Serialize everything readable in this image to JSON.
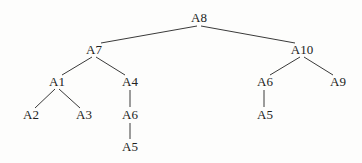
{
  "diagram": {
    "type": "tree",
    "nodes": [
      {
        "id": "n_A8",
        "label": "A8",
        "x": 199,
        "y": 18
      },
      {
        "id": "n_A7",
        "label": "A7",
        "x": 94,
        "y": 50
      },
      {
        "id": "n_A10",
        "label": "A10",
        "x": 302,
        "y": 50
      },
      {
        "id": "n_A1",
        "label": "A1",
        "x": 57,
        "y": 82
      },
      {
        "id": "n_A4",
        "label": "A4",
        "x": 130,
        "y": 82
      },
      {
        "id": "n_A2",
        "label": "A2",
        "x": 31,
        "y": 115
      },
      {
        "id": "n_A3",
        "label": "A3",
        "x": 84,
        "y": 115
      },
      {
        "id": "n_A6a",
        "label": "A6",
        "x": 130,
        "y": 115
      },
      {
        "id": "n_A5a",
        "label": "A5",
        "x": 130,
        "y": 147
      },
      {
        "id": "n_A6b",
        "label": "A6",
        "x": 265,
        "y": 82
      },
      {
        "id": "n_A9",
        "label": "A9",
        "x": 338,
        "y": 82
      },
      {
        "id": "n_A5b",
        "label": "A5",
        "x": 265,
        "y": 115
      }
    ],
    "edges": [
      {
        "from": "n_A8",
        "to": "n_A7",
        "x1": 197,
        "y1": 26,
        "x2": 101,
        "y2": 43
      },
      {
        "from": "n_A8",
        "to": "n_A10",
        "x1": 201,
        "y1": 26,
        "x2": 295,
        "y2": 43
      },
      {
        "from": "n_A7",
        "to": "n_A1",
        "x1": 92,
        "y1": 57,
        "x2": 62,
        "y2": 75
      },
      {
        "from": "n_A7",
        "to": "n_A4",
        "x1": 96,
        "y1": 57,
        "x2": 125,
        "y2": 75
      },
      {
        "from": "n_A1",
        "to": "n_A2",
        "x1": 55,
        "y1": 89,
        "x2": 35,
        "y2": 108
      },
      {
        "from": "n_A1",
        "to": "n_A3",
        "x1": 59,
        "y1": 89,
        "x2": 80,
        "y2": 108
      },
      {
        "from": "n_A4",
        "to": "n_A6a",
        "x1": 130,
        "y1": 90,
        "x2": 130,
        "y2": 107
      },
      {
        "from": "n_A6a",
        "to": "n_A5a",
        "x1": 130,
        "y1": 123,
        "x2": 130,
        "y2": 139
      },
      {
        "from": "n_A10",
        "to": "n_A6b",
        "x1": 300,
        "y1": 57,
        "x2": 270,
        "y2": 75
      },
      {
        "from": "n_A10",
        "to": "n_A9",
        "x1": 304,
        "y1": 57,
        "x2": 333,
        "y2": 75
      },
      {
        "from": "n_A6b",
        "to": "n_A5b",
        "x1": 264,
        "y1": 90,
        "x2": 264,
        "y2": 107
      }
    ]
  }
}
